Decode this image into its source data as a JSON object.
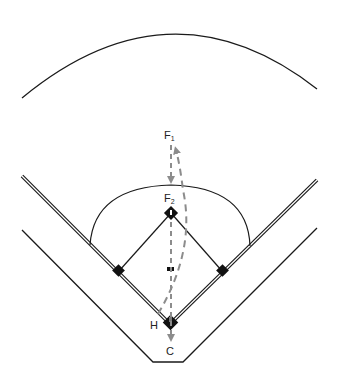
{
  "diagram": {
    "type": "baseball-field-play-diagram",
    "labels": {
      "f1": {
        "main": "F",
        "sub": "1"
      },
      "f2": {
        "main": "F",
        "sub": "2"
      },
      "home": "H",
      "catcher": "C"
    },
    "colors": {
      "lines": "#1a1a1a",
      "arrows": "#8c8c8c",
      "bases": "#111111",
      "background": "#ffffff"
    },
    "arrows": [
      {
        "name": "f1-to-f2",
        "style": "dashed-straight",
        "from": "F1",
        "to": "F2"
      },
      {
        "name": "home-to-f1",
        "style": "dashed-curved",
        "from": "H",
        "to": "F1"
      },
      {
        "name": "f2-to-catcher",
        "style": "dashed-straight",
        "from": "F2",
        "to": "C"
      }
    ]
  }
}
